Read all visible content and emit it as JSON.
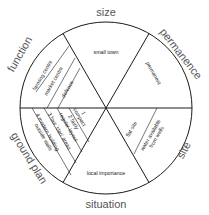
{
  "diagram": {
    "center": [
      106,
      108
    ],
    "radius": 86,
    "line_color": "#1a1a1a",
    "categories": [
      {
        "name": "size",
        "items": [
          "small town"
        ]
      },
      {
        "name": "permanence",
        "items": [
          "permanent"
        ]
      },
      {
        "name": "site",
        "items": [
          "flat site",
          "water available",
          "from wells"
        ]
      },
      {
        "name": "situation",
        "items": [
          "local importance"
        ]
      },
      {
        "name": "ground plan",
        "items": [
          "1",
          "compact",
          "2 fairly",
          "regular layout",
          "3 four 'clan' areas",
          "4 modern building",
          "outside walls"
        ]
      },
      {
        "name": "function",
        "items": [
          "farming centre",
          "market centre",
          "defence"
        ]
      }
    ]
  }
}
